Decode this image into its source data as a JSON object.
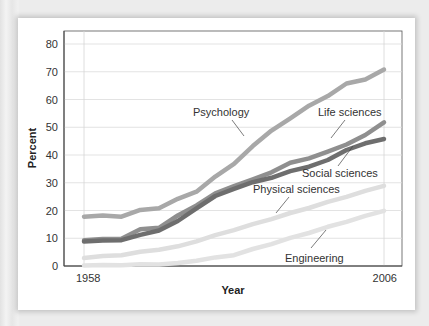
{
  "chart_data": {
    "type": "line",
    "title": "",
    "xlabel": "Year",
    "ylabel": "Percent",
    "xlim": [
      1958,
      2006
    ],
    "ylim": [
      0,
      80
    ],
    "grid": true,
    "legend_position": "inline labels",
    "x_tick_labels": [
      "1958",
      "2006"
    ],
    "y_tick_labels": [
      "0",
      "10",
      "20",
      "30",
      "40",
      "50",
      "60",
      "70",
      "80"
    ],
    "x": [
      1958,
      1961,
      1964,
      1967,
      1970,
      1973,
      1976,
      1979,
      1982,
      1985,
      1988,
      1991,
      1994,
      1997,
      2000,
      2003,
      2006
    ],
    "series": [
      {
        "name": "Psychology",
        "color": "#a8a8a8",
        "values": [
          18,
          18,
          18,
          20,
          21,
          24,
          27,
          32,
          37,
          43,
          49,
          53,
          58,
          61,
          66,
          67,
          71
        ]
      },
      {
        "name": "Life sciences",
        "color": "#8f8f8f",
        "values": [
          9.5,
          9.5,
          10,
          13,
          14,
          18,
          22,
          26,
          29,
          31,
          34,
          37,
          39,
          41,
          44,
          47,
          52
        ]
      },
      {
        "name": "Social sciences",
        "color": "#6e6e6e",
        "values": [
          9,
          9,
          9.5,
          11,
          13,
          16,
          21,
          25,
          28,
          30,
          32,
          34,
          36,
          38,
          42,
          44,
          46
        ]
      },
      {
        "name": "Physical sciences",
        "color": "#dedede",
        "values": [
          3,
          3.5,
          4,
          5,
          6,
          7,
          9,
          11,
          13,
          15,
          17,
          19,
          21,
          23,
          25,
          27,
          29
        ]
      },
      {
        "name": "Engineering",
        "color": "#e2e2e2",
        "values": [
          0.3,
          0.3,
          0.4,
          0.5,
          0.7,
          1,
          2,
          3,
          4,
          6,
          8,
          10,
          12,
          14,
          16,
          18,
          20
        ]
      }
    ]
  },
  "axes": {
    "x_title": "Year",
    "y_title": "Percent",
    "x_start_label": "1958",
    "x_end_label": "2006",
    "y_ticks": [
      "0",
      "10",
      "20",
      "30",
      "40",
      "50",
      "60",
      "70",
      "80"
    ]
  },
  "labels": {
    "psychology": "Psychology",
    "life_sciences": "Life sciences",
    "social_sciences": "Social sciences",
    "physical_sciences": "Physical sciences",
    "engineering": "Engineering"
  }
}
